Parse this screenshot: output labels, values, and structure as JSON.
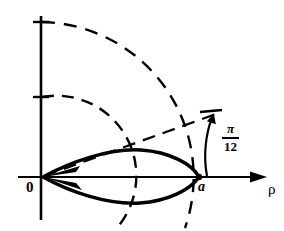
{
  "figure": {
    "type": "polar-coordinate-diagram",
    "background_color": "#ffffff",
    "stroke_color": "#000000",
    "labels": {
      "origin": "0",
      "point_a": "a",
      "axis_radial": "ρ",
      "angle_numerator": "π",
      "angle_denominator": "12"
    },
    "angle_value": "π/12",
    "axes": {
      "vertical_axis_x": 41,
      "horizontal_axis_y": 177,
      "origin_x": 42,
      "origin_y": 177,
      "rho_axis_end_x": 266
    },
    "arcs": [
      {
        "name": "inner-dashed-arc",
        "radius": 80,
        "start_on_vertical_axis_y": 97
      },
      {
        "name": "outer-dashed-arc",
        "radius": 155,
        "start_on_vertical_axis_y": 22
      }
    ],
    "radial_dashed_line": {
      "name": "radial-ray-pi-over-12",
      "from": [
        42,
        177
      ],
      "to": [
        215,
        115
      ]
    },
    "curve": {
      "name": "lens-shaped-closed-curve",
      "from_x": 42,
      "to_x": 199,
      "max_half_height": 28
    }
  }
}
